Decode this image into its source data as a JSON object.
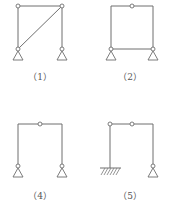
{
  "diagram": {
    "type": "structural-frames",
    "colors": {
      "line": "#6e6e6e",
      "label": "#555555",
      "background": "#ffffff"
    },
    "figures": [
      {
        "id": "fig1",
        "label": "（1）",
        "description": "Rectangular frame, hinged top corners, diagonal bar from top-right to bottom-left, two pinned supports",
        "hinges": [
          [
            18,
            6
          ],
          [
            62,
            6
          ],
          [
            18,
            49
          ],
          [
            62,
            49
          ]
        ],
        "supports": [
          "pin",
          "pin"
        ],
        "diagonal": true
      },
      {
        "id": "fig2",
        "label": "（2）",
        "description": "Closed rectangular frame with hinge at mid-top beam, bottom tie, two pinned supports",
        "hinges": [
          [
            132,
            6
          ],
          [
            111,
            49
          ],
          [
            153,
            49
          ]
        ],
        "supports": [
          "pin",
          "pin"
        ]
      },
      {
        "id": "fig4",
        "label": "（4）",
        "description": "Portal frame with hinge at mid-top beam, two pinned supports",
        "hinges": [
          [
            40,
            124
          ],
          [
            18,
            166
          ],
          [
            62,
            166
          ]
        ],
        "supports": [
          "pin",
          "pin"
        ]
      },
      {
        "id": "fig5",
        "label": "（5）",
        "description": "Frame with fixed left support, two hinges on top beam, pinned right support",
        "hinges": [
          [
            110,
            124
          ],
          [
            132,
            124
          ],
          [
            153,
            166
          ]
        ],
        "supports": [
          "fixed",
          "pin"
        ]
      }
    ]
  }
}
